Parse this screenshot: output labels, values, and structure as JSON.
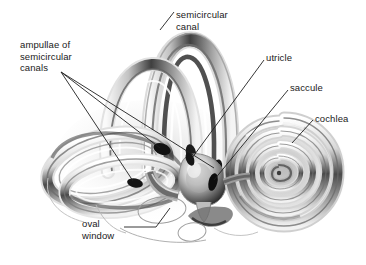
{
  "figure": {
    "style": "grayscale pencil/airbrush rendering on white background",
    "background_color": "#ffffff",
    "ink_color": "#1a1a1a"
  },
  "labels": {
    "ampullae": "ampullae of\nsemicircular\ncanals",
    "semicircular_canal": "semicircular\ncanal",
    "utricle": "utricle",
    "saccule": "saccule",
    "cochlea": "cochlea",
    "oval_window": "oval\nwindow"
  },
  "structures": [
    {
      "name": "superior-semicircular-canal",
      "kind": "arch-loop"
    },
    {
      "name": "posterior-semicircular-canal",
      "kind": "arch-loop"
    },
    {
      "name": "lateral-semicircular-canal",
      "kind": "ellipse-loop"
    },
    {
      "name": "ampullae",
      "kind": "dark-bulb",
      "count": 3
    },
    {
      "name": "vestibule",
      "kind": "bulb"
    },
    {
      "name": "utricle",
      "kind": "chamber"
    },
    {
      "name": "saccule",
      "kind": "chamber"
    },
    {
      "name": "cochlea",
      "kind": "spiral",
      "turns": 2.6
    },
    {
      "name": "oval-window",
      "kind": "outline-ellipse"
    },
    {
      "name": "round-window",
      "kind": "outline-ellipse"
    }
  ],
  "leader_lines": [
    {
      "from": "ampullae",
      "to": "ampulla-1"
    },
    {
      "from": "ampullae",
      "to": "ampulla-2"
    },
    {
      "from": "ampullae",
      "to": "ampulla-3"
    },
    {
      "from": "semicircular_canal",
      "to": "superior-canal-arch"
    },
    {
      "from": "utricle",
      "to": "utricle-chamber"
    },
    {
      "from": "saccule",
      "to": "saccule-chamber"
    },
    {
      "from": "cochlea",
      "to": "cochlea-outer-turn"
    },
    {
      "from": "oval_window",
      "to": "oval-window-ellipse"
    }
  ]
}
